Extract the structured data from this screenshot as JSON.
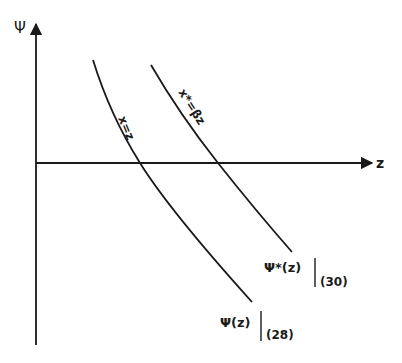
{
  "axes": {
    "y_label": "Ψ",
    "x_label": "z"
  },
  "curves": [
    {
      "id": "psi",
      "label": "x=z",
      "end_label_main": "Ψ(z)",
      "end_label_sub": "(28)"
    },
    {
      "id": "psi-star",
      "label": "x*=βz",
      "end_label_main": "Ψ*(z)",
      "end_label_sub": "(30)"
    }
  ],
  "colors": {
    "ink": "#1a1a1a",
    "background": "#ffffff"
  }
}
